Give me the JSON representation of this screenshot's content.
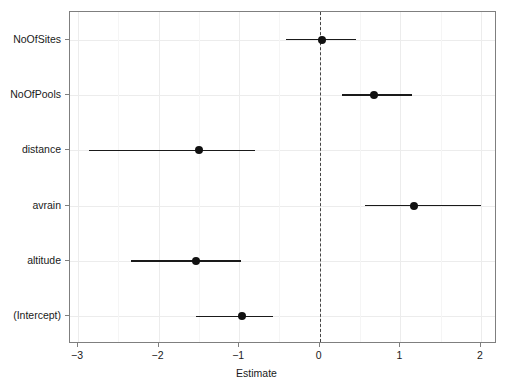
{
  "chart_data": {
    "type": "scatter",
    "plot_kind": "coefficient-forest-plot",
    "title": "",
    "xlabel": "Estimate",
    "ylabel": "",
    "xlim": [
      -3.1,
      2.2
    ],
    "xticks": [
      -3,
      -2,
      -1,
      0,
      1,
      2
    ],
    "xticklabels": [
      "−3",
      "−2",
      "−1",
      "0",
      "1",
      "2"
    ],
    "grid": true,
    "legend": null,
    "reference_line": {
      "x": 0,
      "style": "dashed",
      "color": "#444444"
    },
    "categories": [
      "NoOfSites",
      "NoOfPools",
      "distance",
      "avrain",
      "altitude",
      "(Intercept)"
    ],
    "terms": [
      {
        "label": "NoOfSites",
        "estimate": 0.03,
        "ci_low": -0.42,
        "ci_high": 0.45
      },
      {
        "label": "NoOfPools",
        "estimate": 0.67,
        "ci_low": 0.28,
        "ci_high": 1.15
      },
      {
        "label": "distance",
        "estimate": -1.5,
        "ci_low": -2.86,
        "ci_high": -0.8
      },
      {
        "label": "avrain",
        "estimate": 1.17,
        "ci_low": 0.56,
        "ci_high": 2.0
      },
      {
        "label": "altitude",
        "estimate": -1.53,
        "ci_low": -2.34,
        "ci_high": -0.98
      },
      {
        "label": "(Intercept)",
        "estimate": -0.97,
        "ci_low": -1.54,
        "ci_high": -0.58
      }
    ],
    "colors": {
      "point": "#111111",
      "interval": "#1a1a1a",
      "panel_border": "#7f7f7f",
      "grid": "#ececec",
      "background": "#ffffff"
    }
  }
}
